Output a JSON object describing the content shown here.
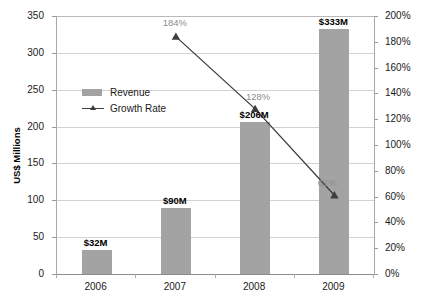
{
  "chart_data": {
    "type": "bar",
    "title": "",
    "subtitle": "",
    "xlabel": "",
    "ylabel": "US$ Millions",
    "y2label": "",
    "categories": [
      "2006",
      "2007",
      "2008",
      "2009"
    ],
    "ylim": [
      0,
      350
    ],
    "y2lim": [
      0,
      200
    ],
    "yticks": [
      "0",
      "50",
      "100",
      "150",
      "200",
      "250",
      "300",
      "350"
    ],
    "ytick_values": [
      0,
      50,
      100,
      150,
      200,
      250,
      300,
      350
    ],
    "y2ticks": [
      "0%",
      "20%",
      "40%",
      "60%",
      "80%",
      "100%",
      "120%",
      "140%",
      "160%",
      "180%",
      "200%"
    ],
    "y2tick_values": [
      0,
      20,
      40,
      60,
      80,
      100,
      120,
      140,
      160,
      180,
      200
    ],
    "grid": true,
    "legend_position": "inside-upper-left",
    "series": [
      {
        "name": "Revenue",
        "type": "bar",
        "axis": "left",
        "color": "#a3a3a3",
        "values": [
          32,
          90,
          206,
          333
        ],
        "labels": [
          "$32M",
          "$90M",
          "$206M",
          "$333M"
        ]
      },
      {
        "name": "Growth Rate",
        "type": "line",
        "axis": "right",
        "color": "#3d3d3d",
        "values": [
          null,
          184,
          128,
          61
        ],
        "labels": [
          "",
          "184%",
          "128%",
          "61%"
        ]
      }
    ]
  },
  "legend": {
    "items": [
      {
        "label": "Revenue",
        "marker": "swatch",
        "color": "#a3a3a3"
      },
      {
        "label": "Growth Rate",
        "marker": "line-triangle",
        "color": "#3d3d3d"
      }
    ]
  },
  "colors": {
    "bar": "#a3a3a3",
    "line": "#3d3d3d",
    "grid": "#d2d2d2",
    "axis": "#a8a8a8",
    "text": "#1a1a1a",
    "pct_label": "#8e8e8e",
    "background": "#ffffff"
  }
}
